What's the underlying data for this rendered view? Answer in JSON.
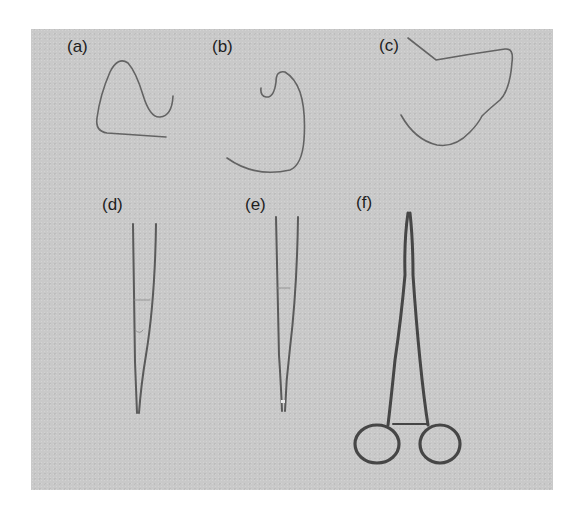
{
  "figure": {
    "panel_background": "#c9c9c9",
    "ink_color": "#5e5e5e",
    "instrument_color": "#4a4a4a",
    "labels": {
      "a": "(a)",
      "b": "(b)",
      "c": "(c)",
      "d": "(d)",
      "e": "(e)",
      "f": "(f)"
    },
    "items": [
      {
        "label": "(a)",
        "depicts": "bent wire / suture shape"
      },
      {
        "label": "(b)",
        "depicts": "bent wire / suture shape"
      },
      {
        "label": "(c)",
        "depicts": "bent wire / suture shape"
      },
      {
        "label": "(d)",
        "depicts": "fine forceps"
      },
      {
        "label": "(e)",
        "depicts": "fine forceps"
      },
      {
        "label": "(f)",
        "depicts": "needle holder / hemostat"
      }
    ]
  }
}
